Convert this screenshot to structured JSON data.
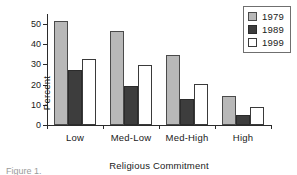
{
  "chart_data": {
    "type": "bar",
    "title": "",
    "xlabel": "Religious Commitment",
    "ylabel": "Percent",
    "categories": [
      "Low",
      "Med-Low",
      "Med-High",
      "High"
    ],
    "series": [
      {
        "name": "1979",
        "values": [
          51.5,
          46.5,
          34.5,
          14.5
        ],
        "color": "#b8b8b8"
      },
      {
        "name": "1989",
        "values": [
          27.5,
          19.5,
          13.0,
          5.0
        ],
        "color": "#3d3d3d"
      },
      {
        "name": "1999",
        "values": [
          32.5,
          29.5,
          20.5,
          9.0
        ],
        "color": "#ffffff"
      }
    ],
    "ylim": [
      0,
      55
    ],
    "yticks": [
      0,
      10,
      20,
      30,
      40,
      50
    ],
    "ytick_labels": [
      "0",
      "10",
      "20",
      "30",
      "40",
      "50"
    ],
    "grid": false,
    "legend_position": "top-right"
  },
  "legend": {
    "entries": [
      {
        "label": "1979"
      },
      {
        "label": "1989"
      },
      {
        "label": "1999"
      }
    ]
  },
  "caption": {
    "text": "Figure 1."
  }
}
